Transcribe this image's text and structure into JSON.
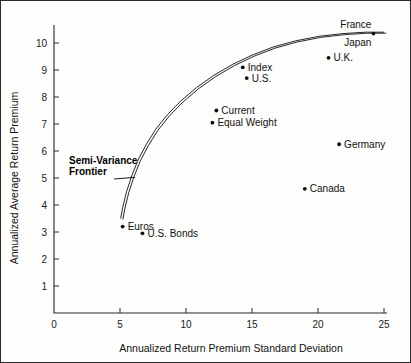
{
  "chart_data": {
    "type": "scatter",
    "title": "",
    "xlabel": "Annualized Return Premium Standard Deviation",
    "ylabel": "Annualized Average Return Premium",
    "xlim": [
      0,
      25
    ],
    "ylim": [
      0,
      10.8
    ],
    "xticks": [
      0,
      5,
      10,
      15,
      20,
      25
    ],
    "xtick_labels": [
      "0",
      "5",
      "10",
      "15",
      "20",
      "25"
    ],
    "yticks": [
      1,
      2,
      3,
      4,
      5,
      6,
      7,
      8,
      9,
      10
    ],
    "ytick_labels": [
      "1",
      "2",
      "3",
      "4",
      "5",
      "6",
      "7",
      "8",
      "9",
      "10"
    ],
    "grid": false,
    "legend": "none",
    "points": [
      {
        "label": "France",
        "x": 24.2,
        "y": 10.35,
        "label_pos": "above"
      },
      {
        "label": "Japan",
        "x": 24.2,
        "y": 10.35,
        "label_pos": "below"
      },
      {
        "label": "U.K.",
        "x": 20.8,
        "y": 9.45,
        "label_pos": "right"
      },
      {
        "label": "Index",
        "x": 14.3,
        "y": 9.1,
        "label_pos": "right"
      },
      {
        "label": "U.S.",
        "x": 14.6,
        "y": 8.7,
        "label_pos": "right"
      },
      {
        "label": "Current",
        "x": 12.3,
        "y": 7.5,
        "label_pos": "right"
      },
      {
        "label": "Equal Weight",
        "x": 12.0,
        "y": 7.05,
        "label_pos": "right"
      },
      {
        "label": "Germany",
        "x": 21.6,
        "y": 6.25,
        "label_pos": "right"
      },
      {
        "label": "Canada",
        "x": 19.0,
        "y": 4.6,
        "label_pos": "right"
      },
      {
        "label": "Euros",
        "x": 5.2,
        "y": 3.2,
        "label_pos": "right"
      },
      {
        "label": "U.S. Bonds",
        "x": 6.7,
        "y": 2.95,
        "label_pos": "right"
      }
    ],
    "annotations": [
      {
        "text_line1": "Semi-Variance",
        "text_line2": "Frontier",
        "target_x": 6.3,
        "target_y": 5.1
      }
    ],
    "curves": [
      {
        "name": "Semi-Variance Frontier",
        "x": [
          5.05,
          5.2,
          5.5,
          5.9,
          6.4,
          7.0,
          7.7,
          8.6,
          9.6,
          10.8,
          12.1,
          13.5,
          15.0,
          16.6,
          18.3,
          20.1,
          21.9,
          23.6,
          25.0
        ],
        "y": [
          3.5,
          3.9,
          4.5,
          5.1,
          5.7,
          6.25,
          6.8,
          7.35,
          7.85,
          8.35,
          8.8,
          9.2,
          9.55,
          9.85,
          10.08,
          10.25,
          10.35,
          10.4,
          10.4
        ]
      }
    ]
  },
  "colors": {
    "axis": "#2b2b2b",
    "marker": "#0d0d0d",
    "curve": "#111111",
    "text": "#111111",
    "background": "#fdfdfc",
    "frame": "#2a2a2a"
  }
}
